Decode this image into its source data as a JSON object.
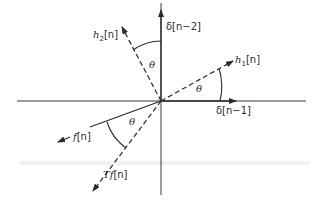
{
  "diagram": {
    "type": "vector-space-rotation",
    "origin": [
      161,
      101
    ],
    "colors": {
      "stroke": "#2a2a2a",
      "axis": "#3a3a3a",
      "background": "#ffffff"
    },
    "axes": {
      "horizontal": {
        "label": "δ[n−1]"
      },
      "vertical": {
        "label": "δ[n−2]"
      }
    },
    "vectors": [
      {
        "id": "h1",
        "label_base": "h",
        "label_sub": "1",
        "label_arg": "[n]",
        "style": "dashed"
      },
      {
        "id": "h2",
        "label_base": "h",
        "label_sub": "2",
        "label_arg": "[n]",
        "style": "dashed"
      },
      {
        "id": "f",
        "label_base": "f",
        "label_arg": "[n]",
        "style": "solid"
      },
      {
        "id": "Tf",
        "label_base": "Tf",
        "label_arg": "[n]",
        "style": "dashed"
      }
    ],
    "angles": [
      {
        "between": [
          "δ[n−1]",
          "h1[n]"
        ],
        "label": "θ"
      },
      {
        "between": [
          "δ[n−2]",
          "h2[n]"
        ],
        "label": "θ"
      },
      {
        "between": [
          "f[n]",
          "Tf[n]"
        ],
        "label": "θ"
      }
    ]
  }
}
